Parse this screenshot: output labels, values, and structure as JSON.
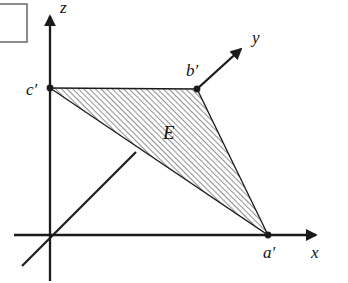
{
  "figure": {
    "canvas": {
      "width": 348,
      "height": 283,
      "background": "#ffffff"
    },
    "ink_color": "#1a1a1a",
    "hatch_color": "#555555",
    "axes": {
      "z": {
        "label": "z",
        "label_x": 60,
        "label_y": 13,
        "from_x": 50,
        "from_y": 281,
        "to_x": 50,
        "to_y": 12
      },
      "x": {
        "label": "x",
        "label_x": 311,
        "label_y": 258,
        "from_x": 14,
        "from_y": 235,
        "to_x": 320,
        "to_y": 235
      },
      "y": {
        "label": "y",
        "label_x": 252,
        "label_y": 43,
        "neg_from_x": 22,
        "neg_from_y": 266,
        "neg_to_x": 136,
        "neg_to_y": 152,
        "pos_from_x": 197,
        "pos_from_y": 89,
        "pos_to_x": 245,
        "pos_to_y": 45
      }
    },
    "origin": {
      "x": 50,
      "y": 235
    },
    "region": {
      "name": "E",
      "label": "E",
      "label_x": 163,
      "label_y": 139,
      "polygon": "50,88 197,89 268,235",
      "hatch_angle_deg": 45,
      "hatch_spacing": 4
    },
    "points": [
      {
        "name": "c-prime",
        "label": "c′",
        "x": 50,
        "y": 88,
        "label_x": 26,
        "label_y": 95
      },
      {
        "name": "b-prime",
        "label": "b′",
        "x": 197,
        "y": 89,
        "label_x": 186,
        "label_y": 76
      },
      {
        "name": "a-prime",
        "label": "a′",
        "x": 268,
        "y": 235,
        "label_x": 263,
        "label_y": 258
      }
    ],
    "corner_box": {
      "name": "corner-rectangle",
      "x": -6,
      "y": 4,
      "width": 33,
      "height": 38
    }
  }
}
